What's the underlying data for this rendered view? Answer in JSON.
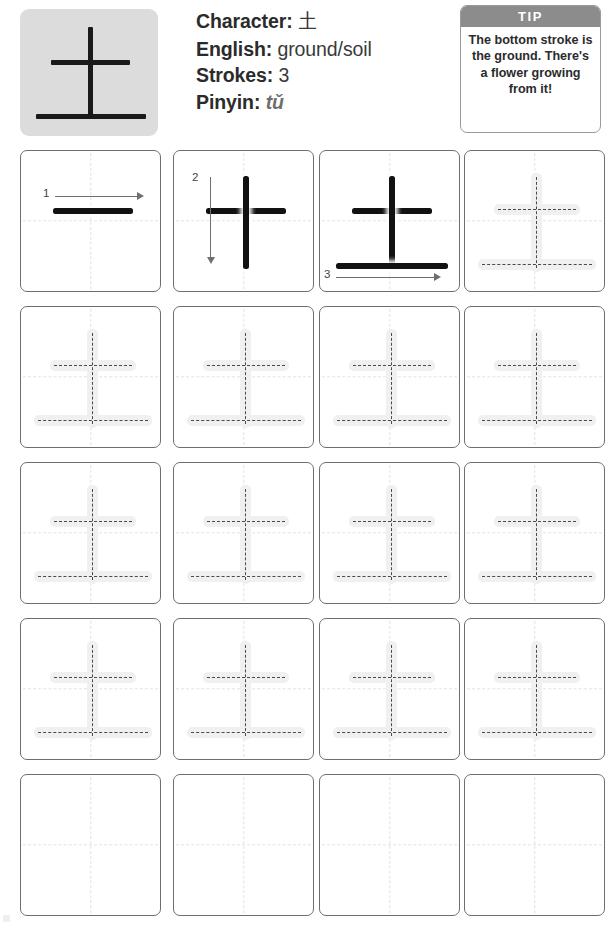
{
  "worksheet": {
    "character": "土",
    "info": {
      "character_label": "Character:",
      "character_value": "土",
      "english_label": "English:",
      "english_value": "ground/soil",
      "strokes_label": "Strokes:",
      "strokes_value": "3",
      "pinyin_label": "Pinyin:",
      "pinyin_value": "tǔ"
    },
    "tip": {
      "heading": "TIP",
      "text": "The bottom stroke is the ground. There's a flower growing from it!"
    },
    "stroke_order": {
      "count": 3,
      "steps": [
        {
          "number": "1",
          "direction": "left-to-right",
          "stroke": "horizontal-top"
        },
        {
          "number": "2",
          "direction": "top-to-bottom",
          "stroke": "vertical"
        },
        {
          "number": "3",
          "direction": "left-to-right",
          "stroke": "horizontal-bottom"
        }
      ]
    },
    "grid": {
      "columns": 4,
      "rows": 5,
      "row_types": [
        "stroke-order",
        "trace",
        "trace",
        "trace",
        "blank"
      ]
    },
    "colors": {
      "tile_background": "#dcdcdc",
      "stroke_black": "#121212",
      "cell_border": "#6e6e6e",
      "guide_line": "#e2e2e2",
      "trace_halo": "#f0f0f0",
      "trace_dash": "#4a4a4a",
      "tip_header": "#8c8c8c",
      "arrow": "#6f6f6f",
      "pinyin_text": "#6e6e6e"
    }
  }
}
